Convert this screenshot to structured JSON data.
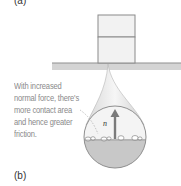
{
  "figure": {
    "panel_a_label": "(a)",
    "panel_b_label": "(b)",
    "caption_lines": [
      "With increased",
      "normal force, there's",
      "more contact area",
      "and hence greater",
      "friction."
    ],
    "vector_label": "n⃗",
    "colors": {
      "block_fill": "#f2f2f2",
      "block_stroke": "#8a8a8a",
      "ground": "#cfcfcf",
      "magnifier_top": "#f4f4f4",
      "magnifier_bottom": "#c8c8c8",
      "arrow": "#777777",
      "caption_text": "#8a8a8a"
    }
  }
}
